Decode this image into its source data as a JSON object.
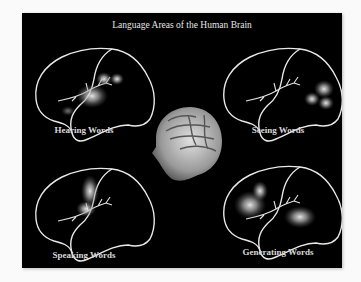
{
  "title": "Language Areas of the Human Brain",
  "panels": [
    {
      "label": "Hearing Words",
      "activation": "temporal (auditory cortex)"
    },
    {
      "label": "Seeing Words",
      "activation": "occipital (visual cortex)"
    },
    {
      "label": "Speaking Words",
      "activation": "motor cortex"
    },
    {
      "label": "Generating Words",
      "activation": "frontal and temporal"
    }
  ],
  "center_image": "3d-head-brain-render",
  "colors": {
    "background": "#000000",
    "outline": "#e8e8e8",
    "text": "#dddddd",
    "page": "#fafafa"
  }
}
